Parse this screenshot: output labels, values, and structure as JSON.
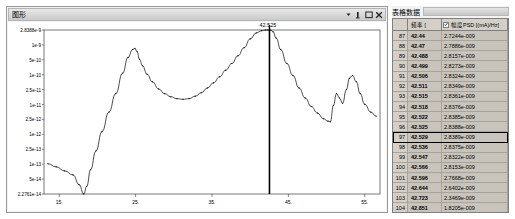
{
  "graph_window": {
    "title": "图形",
    "controls": [
      {
        "name": "dropdown-arrow-icon",
        "glyph": "▾"
      },
      {
        "name": "minimize-icon",
        "glyph": "_"
      },
      {
        "name": "maximize-icon",
        "glyph": "□"
      },
      {
        "name": "close-icon",
        "glyph": "✕"
      }
    ]
  },
  "chart_data": {
    "type": "line",
    "title": "",
    "xlabel": "",
    "ylabel": "",
    "xlim": [
      13.0,
      57.0
    ],
    "ylim_note": "log scale",
    "ytick_labels": [
      "2.8388e-9",
      "1e-9",
      "5e-10",
      "1e-10",
      "2.5e-11",
      "1e-11",
      "2.5e-12",
      "1e-12",
      "2.5e-13",
      "1e-13",
      "5e-14",
      "2.2761e-14"
    ],
    "xtick_labels": [
      "15.",
      "25.",
      "35.",
      "45.",
      "55."
    ],
    "cursor": {
      "label": "42.525",
      "x": 42.525
    },
    "grid": false,
    "legend": null,
    "x": [
      13.5,
      14.6,
      15.7,
      16.8,
      17.6,
      18.2,
      18.6,
      19.1,
      19.8,
      20.6,
      21.5,
      22.4,
      23.3,
      24.0,
      24.6,
      24.9,
      25.2,
      25.5,
      25.9,
      26.5,
      27.2,
      28.0,
      28.8,
      29.6,
      30.4,
      31.2,
      32.0,
      32.8,
      33.6,
      34.4,
      35.2,
      36.0,
      36.8,
      37.6,
      38.4,
      39.2,
      40.0,
      40.8,
      41.5,
      42.0,
      42.3,
      42.5,
      42.7,
      43.0,
      43.4,
      44.0,
      44.8,
      45.6,
      46.4,
      47.2,
      48.0,
      48.8,
      49.6,
      50.2,
      50.5,
      50.9,
      51.3,
      51.7,
      52.1,
      52.6,
      53.0,
      53.4,
      53.9,
      54.4,
      55.0,
      55.8,
      56.5
    ],
    "y": [
      2e-13,
      1.6e-13,
      1.2e-13,
      9e-14,
      4.5e-14,
      2.3e-14,
      4e-14,
      1.3e-13,
      5e-13,
      2e-12,
      8e-12,
      3e-11,
      1.3e-10,
      4e-10,
      7e-10,
      7.6e-10,
      6e-10,
      3.5e-10,
      2.2e-10,
      1.2e-10,
      7e-11,
      4.2e-11,
      3e-11,
      2.4e-11,
      2.1e-11,
      2e-11,
      2.1e-11,
      2.5e-11,
      3.2e-11,
      4.5e-11,
      6.5e-11,
      1e-10,
      1.6e-10,
      2.6e-10,
      4.5e-10,
      8e-10,
      1.5e-09,
      2.3e-09,
      2.7e-09,
      2.83e-09,
      2.838e-09,
      2.8388e-09,
      2.8e-09,
      2.5e-09,
      1.6e-09,
      7e-10,
      2.6e-10,
      1.1e-10,
      4.5e-11,
      2.2e-11,
      1.2e-11,
      7.5e-12,
      5e-12,
      4.2e-12,
      4e-12,
      1.3e-11,
      3e-11,
      2.2e-11,
      1.5e-11,
      4e-11,
      9e-11,
      1.1e-10,
      7e-11,
      3e-11,
      1.4e-11,
      8e-12,
      6e-12
    ]
  },
  "table_panel": {
    "title": "表格数据",
    "columns": [
      {
        "name": "index",
        "label": ""
      },
      {
        "name": "frequency",
        "label": "频率 ["
      },
      {
        "name": "psd",
        "label": "幅度PSD [(mA)/Hz]",
        "checked": true
      }
    ],
    "rows": [
      {
        "index": "87",
        "freq": "42.44",
        "psd": "2.7244e-009",
        "selected": false
      },
      {
        "index": "88",
        "freq": "42.47",
        "psd": "2.7886e-009",
        "selected": false
      },
      {
        "index": "89",
        "freq": "42.488",
        "psd": "2.8157e-009",
        "selected": false
      },
      {
        "index": "90",
        "freq": "42.499",
        "psd": "2.8273e-009",
        "selected": false
      },
      {
        "index": "91",
        "freq": "42.506",
        "psd": "2.8324e-009",
        "selected": false
      },
      {
        "index": "92",
        "freq": "42.511",
        "psd": "2.8349e-009",
        "selected": false
      },
      {
        "index": "93",
        "freq": "42.515",
        "psd": "2.8361e-009",
        "selected": false
      },
      {
        "index": "94",
        "freq": "42.518",
        "psd": "2.8376e-009",
        "selected": false
      },
      {
        "index": "95",
        "freq": "42.522",
        "psd": "2.8385e-009",
        "selected": false
      },
      {
        "index": "96",
        "freq": "42.525",
        "psd": "2.8388e-009",
        "selected": false
      },
      {
        "index": "97",
        "freq": "42.529",
        "psd": "2.8389e-009",
        "selected": true
      },
      {
        "index": "98",
        "freq": "42.536",
        "psd": "2.8375e-009",
        "selected": false
      },
      {
        "index": "99",
        "freq": "42.547",
        "psd": "2.8322e-009",
        "selected": false
      },
      {
        "index": "100",
        "freq": "42.566",
        "psd": "2.8153e-009",
        "selected": false
      },
      {
        "index": "101",
        "freq": "42.596",
        "psd": "2.7668e-009",
        "selected": false
      },
      {
        "index": "102",
        "freq": "42.644",
        "psd": "2.6402e-009",
        "selected": false
      },
      {
        "index": "103",
        "freq": "42.723",
        "psd": "2.3469e-009",
        "selected": false
      },
      {
        "index": "104",
        "freq": "42.851",
        "psd": "1.8205e-009",
        "selected": false
      }
    ]
  }
}
